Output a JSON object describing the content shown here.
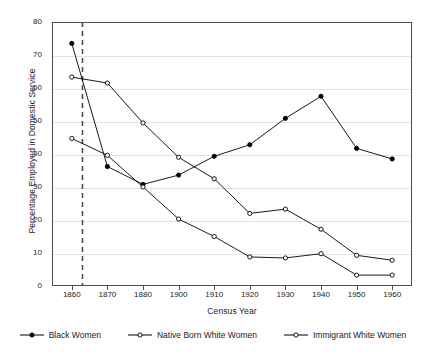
{
  "chart_data": {
    "type": "line",
    "title": "",
    "xlabel": "Census Year",
    "ylabel": "Percentage Employed in Domestic Service",
    "categories": [
      "1860",
      "1870",
      "1880",
      "1900",
      "1910",
      "1920",
      "1930",
      "1940",
      "1950",
      "1960"
    ],
    "x": [
      1860,
      1870,
      1880,
      1900,
      1910,
      1920,
      1930,
      1940,
      1950,
      1960
    ],
    "ylim": [
      0,
      80
    ],
    "yticks": [
      0,
      10,
      20,
      30,
      40,
      50,
      60,
      70,
      80
    ],
    "ytick_labels": [
      "0",
      "10",
      "20",
      "30",
      "40",
      "50",
      "60",
      "70",
      "80"
    ],
    "grid": "horizontal",
    "legend_position": "bottom",
    "series": [
      {
        "name": "Black Women",
        "marker": "filled-circle",
        "color": "#000000",
        "values": [
          73.5,
          36.2,
          30.8,
          33.6,
          39.3,
          42.8,
          50.8,
          57.5,
          41.7,
          38.5
        ]
      },
      {
        "name": "Native Born White Women",
        "marker": "open-circle",
        "color": "#000000",
        "values": [
          44.7,
          39.6,
          30.0,
          20.3,
          15.0,
          8.8,
          8.5,
          9.8,
          3.3,
          3.3
        ]
      },
      {
        "name": "Immigrant White Women",
        "marker": "open-circle",
        "color": "#000000",
        "values": [
          63.3,
          61.5,
          49.4,
          39.0,
          32.5,
          22.0,
          23.3,
          17.2,
          9.3,
          7.8
        ]
      }
    ],
    "annotations": [
      {
        "type": "vertical-dashed-line",
        "x": 1863,
        "label": "",
        "color": "#4d4d4d"
      }
    ]
  },
  "legend": {
    "items": [
      {
        "label": "Black Women"
      },
      {
        "label": "Native Born White Women"
      },
      {
        "label": "Immigrant White Women"
      }
    ]
  },
  "colors": {
    "line": "#1a1a1a",
    "gridline": "#e2e2e2",
    "frame": "#4d4d4d",
    "dashed": "#4d4d4d",
    "background": "#ffffff"
  }
}
